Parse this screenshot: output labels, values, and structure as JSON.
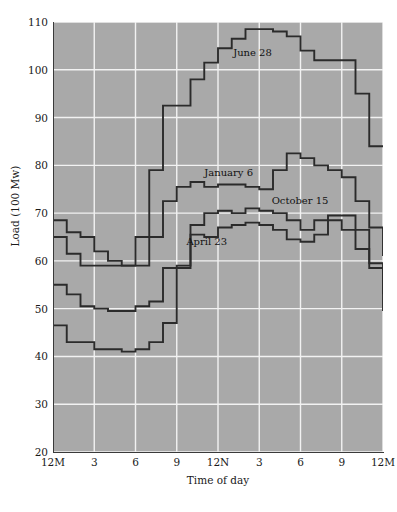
{
  "chart_data": {
    "type": "line",
    "title": "",
    "xlabel": "Time of day",
    "ylabel": "Load (100 Mw)",
    "ylim": [
      20,
      110
    ],
    "yticks": [
      20,
      30,
      40,
      50,
      60,
      70,
      80,
      90,
      100,
      110
    ],
    "xlim": [
      0,
      24
    ],
    "xticks": [
      0,
      3,
      6,
      9,
      12,
      15,
      18,
      21,
      24
    ],
    "xticklabels": [
      "12M",
      "3",
      "6",
      "9",
      "12N",
      "3",
      "6",
      "9",
      "12M"
    ],
    "grid": true,
    "grid_color": "#f2f2f2",
    "plot_background": "#a9a9a9",
    "line_color": "#2b2b2b",
    "drawstyle": "steps",
    "legend_position": "inline-annotations",
    "x": [
      0,
      1,
      2,
      3,
      4,
      5,
      6,
      7,
      8,
      9,
      10,
      11,
      12,
      13,
      14,
      15,
      16,
      17,
      18,
      19,
      20,
      21,
      22,
      23,
      24
    ],
    "series": [
      {
        "name": "June 28",
        "label": "June 28",
        "label_x": 13.1,
        "label_y": 103.5,
        "values": [
          65.0,
          61.5,
          59.0,
          59.0,
          59.0,
          59.0,
          65.0,
          79.0,
          92.5,
          92.5,
          98.0,
          101.5,
          104.5,
          106.5,
          108.5,
          108.5,
          108.0,
          107.0,
          104.0,
          102.0,
          102.0,
          102.0,
          95.0,
          84.0,
          84.0
        ]
      },
      {
        "name": "January 6",
        "label": "January 6",
        "label_x": 11.0,
        "label_y": 78.5,
        "values": [
          68.5,
          66.0,
          65.0,
          62.0,
          60.0,
          59.0,
          59.0,
          65.0,
          72.5,
          75.5,
          76.5,
          75.5,
          76.0,
          76.0,
          75.5,
          75.0,
          79.0,
          82.5,
          81.5,
          80.0,
          79.0,
          77.5,
          72.5,
          67.0,
          61.0
        ]
      },
      {
        "name": "October 15",
        "label": "October 15",
        "label_x": 15.9,
        "label_y": 72.5,
        "values": [
          55.0,
          53.0,
          50.5,
          50.0,
          49.5,
          49.5,
          50.5,
          51.5,
          58.5,
          59.0,
          67.5,
          70.0,
          70.5,
          70.0,
          71.0,
          70.5,
          70.0,
          68.5,
          66.5,
          68.5,
          69.5,
          69.5,
          66.5,
          59.5,
          53.0
        ]
      },
      {
        "name": "April 23",
        "label": "April 23",
        "label_x": 9.7,
        "label_y": 64.0,
        "values": [
          46.5,
          43.0,
          43.0,
          41.5,
          41.5,
          41.0,
          41.5,
          43.0,
          47.0,
          58.5,
          65.5,
          65.0,
          67.0,
          67.5,
          68.0,
          67.5,
          66.5,
          64.5,
          64.0,
          65.5,
          68.5,
          66.5,
          62.5,
          58.5,
          49.5
        ]
      }
    ]
  }
}
